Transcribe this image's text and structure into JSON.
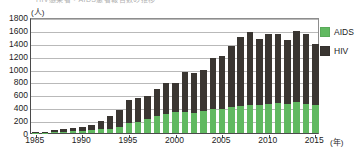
{
  "chart_data": {
    "type": "bar",
    "stacked": true,
    "title": "HIV感染者・AIDS患者報告数の推移",
    "xlabel": "年",
    "ylabel": "人",
    "ylim": [
      0,
      1800
    ],
    "ytick_step": 200,
    "yticks": [
      0,
      200,
      400,
      600,
      800,
      1000,
      1200,
      1400,
      1600,
      1800
    ],
    "xticks": [
      1985,
      1990,
      1995,
      2000,
      2005,
      2010,
      2015
    ],
    "grid": true,
    "legend_position": "right",
    "colors": {
      "aids": "#61b961",
      "hiv": "#3a3632",
      "grid": "#b9b9b9",
      "axis": "#4a4a4a"
    },
    "categories": [
      1985,
      1986,
      1987,
      1988,
      1989,
      1990,
      1991,
      1992,
      1993,
      1994,
      1995,
      1996,
      1997,
      1998,
      1999,
      2000,
      2001,
      2002,
      2003,
      2004,
      2005,
      2006,
      2007,
      2008,
      2009,
      2010,
      2011,
      2012,
      2013,
      2014,
      2015
    ],
    "series": [
      {
        "name": "AIDS",
        "color": "#61b961",
        "values": [
          4,
          8,
          16,
          22,
          28,
          35,
          40,
          55,
          70,
          95,
          160,
          175,
          220,
          260,
          300,
          320,
          330,
          310,
          340,
          380,
          370,
          400,
          415,
          430,
          430,
          450,
          470,
          450,
          480,
          450,
          430
        ]
      },
      {
        "name": "HIV",
        "color": "#3a3632",
        "values": [
          8,
          12,
          24,
          40,
          50,
          60,
          90,
          130,
          190,
          260,
          350,
          370,
          360,
          420,
          470,
          460,
          610,
          620,
          640,
          780,
          830,
          950,
          1080,
          1130,
          1030,
          1080,
          1060,
          1000,
          1100,
          1090,
          950
        ]
      }
    ],
    "totals": [
      12,
      20,
      40,
      62,
      78,
      95,
      130,
      185,
      260,
      355,
      510,
      545,
      580,
      680,
      770,
      780,
      940,
      930,
      980,
      1160,
      1200,
      1350,
      1495,
      1560,
      1460,
      1530,
      1530,
      1450,
      1580,
      1540,
      1380
    ]
  },
  "legend": {
    "items": [
      {
        "label": "AIDS",
        "color": "#61b961"
      },
      {
        "label": "HIV",
        "color": "#3a3632"
      }
    ]
  },
  "axis": {
    "y_unit": "(人)",
    "x_unit": "(年)"
  }
}
